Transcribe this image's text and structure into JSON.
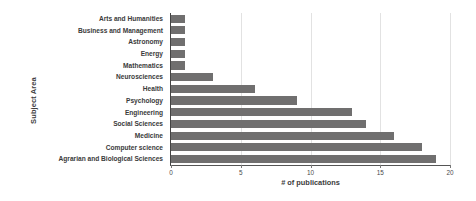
{
  "chart_data": {
    "type": "bar",
    "orientation": "horizontal",
    "title": "",
    "xlabel": "# of publications",
    "ylabel": "Subject Area",
    "categories": [
      "Arts and Humanities",
      "Business and Management",
      "Astronomy",
      "Energy",
      "Mathematics",
      "Neurosciences",
      "Health",
      "Psychology",
      "Engineering",
      "Social Sciences",
      "Medicine",
      "Computer science",
      "Agrarian and Biological Sciences"
    ],
    "values": [
      1,
      1,
      1,
      1,
      1,
      3,
      6,
      9,
      13,
      14,
      16,
      18,
      19
    ],
    "xlim": [
      0,
      20
    ],
    "xticks": [
      0,
      5,
      10,
      15,
      20
    ],
    "xtick_labels": [
      "0",
      "5",
      "10",
      "15",
      "20"
    ],
    "grid": true,
    "grid_axis": "x",
    "legend": false,
    "bar_color": "#706f6f",
    "background_color": "#ffffff",
    "gridline_color": "#e2e2e2",
    "axis_color": "#555555"
  }
}
